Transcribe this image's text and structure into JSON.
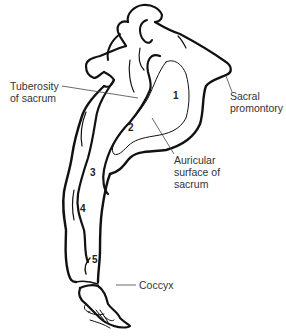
{
  "diagram": {
    "labels": {
      "tuberosity": [
        "Tuberosity",
        "of sacrum"
      ],
      "promontory": [
        "Sacral",
        "promontory"
      ],
      "auricular": [
        "Auricular",
        "surface of",
        "sacrum"
      ],
      "coccyx": [
        "Coccyx"
      ]
    },
    "segment_numbers": [
      "1",
      "2",
      "3",
      "4",
      "5"
    ],
    "colors": {
      "line": "#111111",
      "text": "#333333",
      "background": "#ffffff"
    }
  }
}
